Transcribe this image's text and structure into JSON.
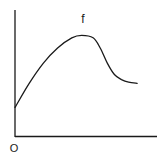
{
  "diagram": {
    "type": "function-sketch",
    "function_label": "f",
    "origin_label": "O",
    "colors": {
      "axis": "#1a1a1a",
      "curve": "#1a1a1a",
      "background": "#ffffff"
    }
  },
  "chart_data": {
    "type": "line",
    "title": "f",
    "xlabel": "",
    "ylabel": "",
    "origin_label": "O",
    "grid": false,
    "xlim": [
      0,
      1
    ],
    "ylim": [
      0,
      1
    ],
    "series": [
      {
        "name": "f",
        "x": [
          0.0,
          0.1,
          0.2,
          0.3,
          0.4,
          0.47,
          0.55,
          0.6,
          0.65,
          0.7,
          0.75,
          0.8,
          0.86
        ],
        "y": [
          0.23,
          0.42,
          0.58,
          0.7,
          0.78,
          0.8,
          0.78,
          0.7,
          0.58,
          0.49,
          0.45,
          0.43,
          0.42
        ]
      }
    ]
  }
}
